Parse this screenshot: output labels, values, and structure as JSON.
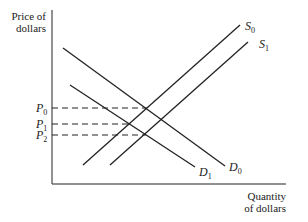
{
  "diagram": {
    "type": "supply-demand",
    "y_axis": {
      "title_line1": "Price of",
      "title_line2": "dollars"
    },
    "x_axis": {
      "title_line1": "Quantity",
      "title_line2": "of dollars"
    },
    "curves": [
      {
        "name": "S",
        "sub": "0",
        "kind": "supply",
        "from": [
          83,
          165
        ],
        "to": [
          240,
          25
        ]
      },
      {
        "name": "S",
        "sub": "1",
        "kind": "supply",
        "from": [
          110,
          165
        ],
        "to": [
          248,
          42
        ]
      },
      {
        "name": "D",
        "sub": "0",
        "kind": "demand",
        "from": [
          63,
          48
        ],
        "to": [
          225,
          166
        ]
      },
      {
        "name": "D",
        "sub": "1",
        "kind": "demand",
        "from": [
          70,
          85
        ],
        "to": [
          195,
          167
        ]
      }
    ],
    "price_levels": [
      {
        "name": "P",
        "sub": "0",
        "y": 108,
        "x_end": 146
      },
      {
        "name": "P",
        "sub": "1",
        "y": 124,
        "x_end": 128
      },
      {
        "name": "P",
        "sub": "2",
        "y": 135,
        "x_end": 146
      }
    ],
    "colors": {
      "line": "#222222",
      "background": "#ffffff"
    }
  }
}
